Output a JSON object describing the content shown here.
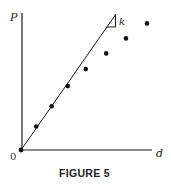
{
  "figure": {
    "caption": "FIGURE 5",
    "y_axis_label": "P",
    "x_axis_label": "d",
    "origin_label": "0",
    "slope_label": "k"
  },
  "chart_data": {
    "type": "scatter",
    "title": "FIGURE 5",
    "xlabel": "d",
    "ylabel": "P",
    "origin": "0",
    "xlim": [
      0,
      10.5
    ],
    "ylim": [
      0,
      10.5
    ],
    "grid": false,
    "series": [
      {
        "name": "data points",
        "x": [
          0,
          1.15,
          2.4,
          3.7,
          5.15,
          6.8,
          8.4,
          10.1
        ],
        "y": [
          0,
          1.8,
          3.35,
          4.9,
          6.2,
          7.4,
          8.55,
          9.7
        ]
      },
      {
        "name": "initial slope line",
        "type": "line",
        "x": [
          0,
          7.2
        ],
        "y": [
          0,
          9.9
        ],
        "annotation": "k"
      }
    ],
    "annotations": [
      {
        "text": "k",
        "description": "slope triangle at top of straight line"
      }
    ]
  },
  "colors": {
    "ink": "#1a1a1a",
    "background": "#ffffff"
  }
}
